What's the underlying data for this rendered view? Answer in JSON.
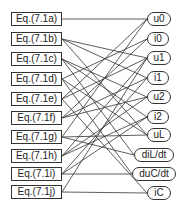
{
  "diagram": {
    "type": "bipartite-graph",
    "equations": [
      {
        "label": "Eq.(7.1a)",
        "y": 19
      },
      {
        "label": "Eq.(7.1b)",
        "y": 39
      },
      {
        "label": "Eq.(7.1c)",
        "y": 59
      },
      {
        "label": "Eq.(7.1d)",
        "y": 79
      },
      {
        "label": "Eq.(7.1e)",
        "y": 99
      },
      {
        "label": "Eq.(7.1f)",
        "y": 118
      },
      {
        "label": "Eq.(7.1g)",
        "y": 137
      },
      {
        "label": "Eq.(7.1h)",
        "y": 156
      },
      {
        "label": "Eq.(7.1i)",
        "y": 174
      },
      {
        "label": "Eq.(7.1j)",
        "y": 192
      }
    ],
    "variables": [
      {
        "label": "u0",
        "y": 19,
        "x": 147,
        "w": 24
      },
      {
        "label": "i0",
        "y": 39,
        "x": 147,
        "w": 22
      },
      {
        "label": "u1",
        "y": 58,
        "x": 147,
        "w": 24
      },
      {
        "label": "i1",
        "y": 78,
        "x": 147,
        "w": 22
      },
      {
        "label": "u2",
        "y": 97,
        "x": 147,
        "w": 24
      },
      {
        "label": "i2",
        "y": 117,
        "x": 147,
        "w": 22
      },
      {
        "label": "uL",
        "y": 135,
        "x": 147,
        "w": 24
      },
      {
        "label": "diL/dt",
        "y": 155,
        "x": 134,
        "w": 40
      },
      {
        "label": "duC/dt",
        "y": 174,
        "x": 132,
        "w": 44
      },
      {
        "label": "iC",
        "y": 193,
        "x": 147,
        "w": 24
      }
    ],
    "edges": [
      [
        0,
        0
      ],
      [
        1,
        2
      ],
      [
        1,
        3
      ],
      [
        1,
        6
      ],
      [
        2,
        4
      ],
      [
        2,
        5
      ],
      [
        2,
        7
      ],
      [
        3,
        1
      ],
      [
        3,
        6
      ],
      [
        3,
        8
      ],
      [
        4,
        0
      ],
      [
        4,
        2
      ],
      [
        4,
        9
      ],
      [
        5,
        1
      ],
      [
        5,
        3
      ],
      [
        5,
        4
      ],
      [
        6,
        0
      ],
      [
        6,
        6
      ],
      [
        6,
        7
      ],
      [
        7,
        2
      ],
      [
        7,
        4
      ],
      [
        7,
        5
      ],
      [
        8,
        3
      ],
      [
        8,
        5
      ],
      [
        8,
        8
      ],
      [
        9,
        2
      ],
      [
        9,
        9
      ]
    ],
    "line_color": "#333333"
  }
}
